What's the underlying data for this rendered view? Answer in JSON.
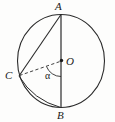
{
  "diagram": {
    "type": "circle-geometry",
    "title": "",
    "stroke_color": "#2b2b2b",
    "background_color": "#fdfdfc",
    "circle": {
      "center_label": "O",
      "center": {
        "x": 61,
        "y": 61
      },
      "radius_x": 44,
      "radius_y": 47
    },
    "points": [
      {
        "label": "A",
        "x": 61,
        "y": 14,
        "position": "top"
      },
      {
        "label": "B",
        "x": 61,
        "y": 108,
        "position": "bottom"
      },
      {
        "label": "C",
        "x": 18,
        "y": 76,
        "position": "left"
      },
      {
        "label": "O",
        "x": 61,
        "y": 61,
        "position": "center"
      }
    ],
    "segments": [
      {
        "name": "diameter-AB",
        "from": "A",
        "to": "B",
        "style": "solid"
      },
      {
        "name": "chord-AC",
        "from": "A",
        "to": "C",
        "style": "solid"
      },
      {
        "name": "chord-CB",
        "from": "C",
        "to": "B",
        "style": "solid"
      },
      {
        "name": "radius-CO",
        "from": "C",
        "to": "O",
        "style": "dashed"
      }
    ],
    "angles": [
      {
        "label": "α",
        "at": "O",
        "between": [
          "C",
          "B"
        ],
        "marker": "arc"
      }
    ],
    "labels": {
      "A": "A",
      "B": "B",
      "C": "C",
      "O": "O",
      "alpha": "α"
    }
  }
}
